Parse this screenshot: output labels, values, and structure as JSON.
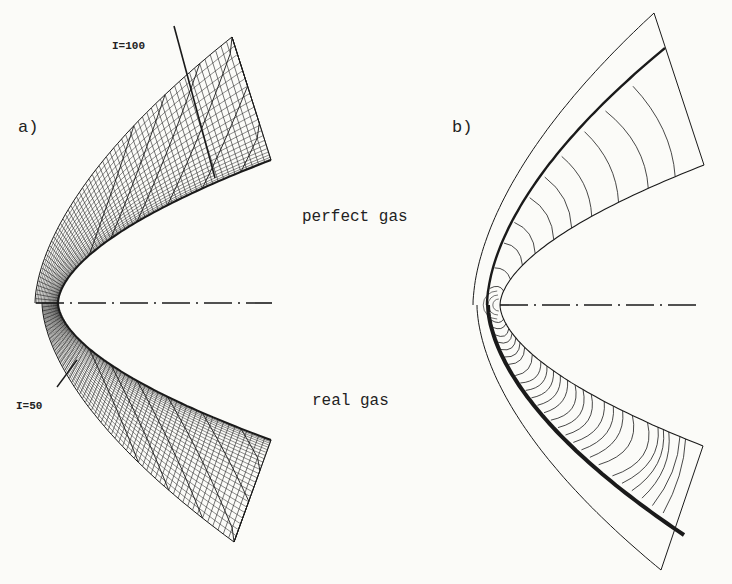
{
  "figure": {
    "panels": [
      {
        "id": "a",
        "label": "a)",
        "content": "computational grid (mesh) around blunt body"
      },
      {
        "id": "b",
        "label": "b)",
        "content": "contour lines (isolines) of flow field"
      }
    ],
    "upper_half_label": "perfect gas",
    "lower_half_label": "real gas",
    "grid_line_labels": {
      "upper": "I=100",
      "lower": "I=50"
    },
    "colors": {
      "ink": "#1a1a1a",
      "paper": "#fbfbf8"
    }
  }
}
